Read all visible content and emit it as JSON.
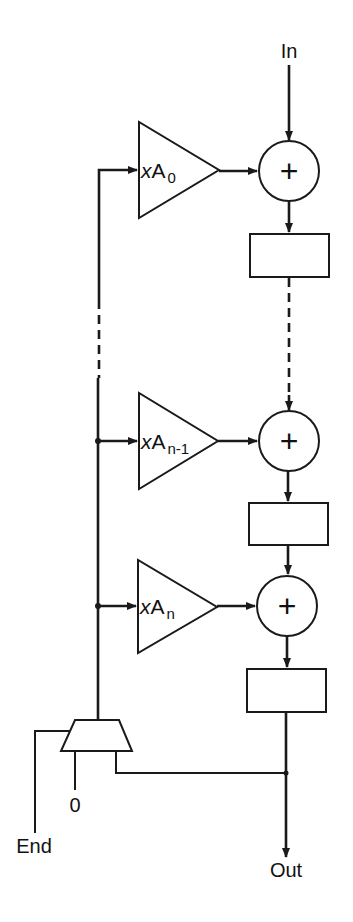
{
  "diagram": {
    "type": "block-diagram",
    "title": "",
    "labels": {
      "input": "In",
      "output": "Out",
      "end": "End",
      "zero": "0"
    },
    "gains": [
      {
        "prefix": "x",
        "base": "A",
        "subscript": "0"
      },
      {
        "prefix": "x",
        "base": "A",
        "subscript": "n-1"
      },
      {
        "prefix": "x",
        "base": "A",
        "subscript": "n"
      }
    ],
    "adders": [
      {
        "symbol": "+"
      },
      {
        "symbol": "+"
      },
      {
        "symbol": "+"
      }
    ],
    "registers": 3,
    "multiplexer": {
      "inputs": [
        "End",
        "0",
        "Out feedback"
      ]
    },
    "colors": {
      "stroke": "#1a1a1a",
      "background": "#ffffff"
    }
  }
}
